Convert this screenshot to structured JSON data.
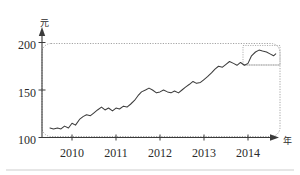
{
  "chart_data": {
    "type": "line",
    "title": "",
    "subtitle": "",
    "xlabel": "年",
    "ylabel": "元",
    "ylim": [
      100,
      200
    ],
    "xlim": [
      2009.5,
      2014.65
    ],
    "grid": false,
    "legend": null,
    "y_ticks": [
      100,
      150,
      200
    ],
    "y_tick_labels": [
      "100",
      "150",
      "200"
    ],
    "x_ticks": [
      2010,
      2011,
      2012,
      2013,
      2014
    ],
    "x_tick_labels": [
      "2010",
      "2011",
      "2012",
      "2013",
      "2014"
    ],
    "series": [
      {
        "name": "价格",
        "x": [
          2009.5,
          2009.58,
          2009.67,
          2009.75,
          2009.83,
          2009.92,
          2010.0,
          2010.08,
          2010.17,
          2010.25,
          2010.33,
          2010.42,
          2010.5,
          2010.58,
          2010.67,
          2010.75,
          2010.83,
          2010.92,
          2011.0,
          2011.08,
          2011.17,
          2011.25,
          2011.33,
          2011.42,
          2011.5,
          2011.58,
          2011.67,
          2011.75,
          2011.83,
          2011.92,
          2012.0,
          2012.08,
          2012.17,
          2012.25,
          2012.33,
          2012.42,
          2012.5,
          2012.58,
          2012.67,
          2012.75,
          2012.83,
          2012.92,
          2013.0,
          2013.08,
          2013.17,
          2013.25,
          2013.33,
          2013.42,
          2013.5,
          2013.58,
          2013.67,
          2013.75,
          2013.83,
          2013.92,
          2014.0,
          2014.08,
          2014.17,
          2014.25,
          2014.33,
          2014.42,
          2014.5,
          2014.58,
          2014.63
        ],
        "y": [
          110,
          109,
          110,
          109,
          112,
          110,
          115,
          113,
          119,
          122,
          124,
          123,
          126,
          129,
          132,
          129,
          131,
          128,
          131,
          130,
          133,
          132,
          135,
          139,
          144,
          148,
          150,
          152,
          150,
          147,
          148,
          150,
          148,
          147,
          149,
          147,
          150,
          153,
          156,
          159,
          157,
          158,
          161,
          164,
          168,
          172,
          175,
          174,
          177,
          180,
          178,
          176,
          179,
          176,
          178,
          186,
          190,
          192,
          191,
          190,
          188,
          186,
          188
        ]
      }
    ],
    "annotations": [
      {
        "name": "outer-dashed-frame",
        "kind": "rounded-rect",
        "x_range": [
          2009.52,
          2014.62
        ],
        "y_range": [
          105,
          197
        ]
      },
      {
        "name": "peak-highlight-inset",
        "kind": "rect",
        "x_range": [
          2014.05,
          2014.62
        ],
        "y_range": [
          176,
          196
        ]
      }
    ]
  }
}
